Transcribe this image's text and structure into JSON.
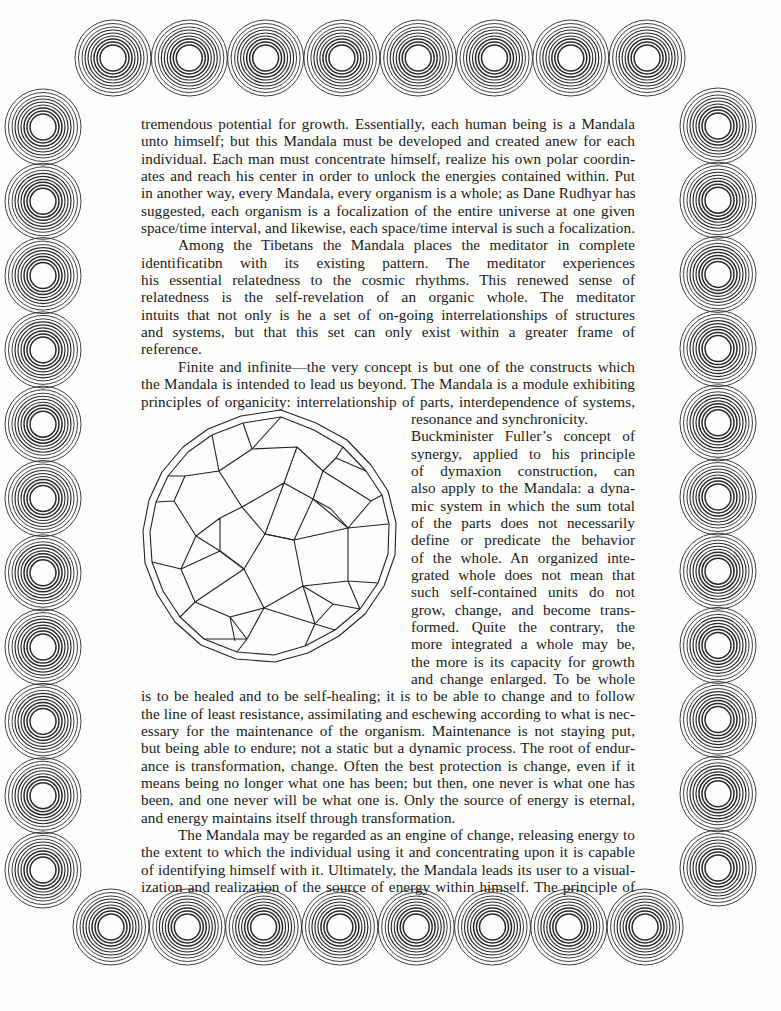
{
  "border": {
    "top_row": {
      "count": 8,
      "x_start": 113,
      "x_step": 76.3,
      "y": 58
    },
    "bottom_row": {
      "count": 8,
      "x_start": 111,
      "x_step": 76.3,
      "y": 927
    },
    "left_column": {
      "count": 11,
      "x": 43,
      "y_start": 127,
      "y_step": 74.3
    },
    "right_column": {
      "count": 11,
      "x": 718,
      "y_start": 126,
      "y_step": 74.2
    },
    "ring_radii": [
      13,
      16,
      19,
      22,
      25,
      28,
      31,
      34.5,
      38
    ],
    "ring_color": "#2a2a2a"
  },
  "body_text": {
    "paragraphs": [
      {
        "id": "p1",
        "lines": [
          "tremendous potential for growth. Essentially, each human being is a Mandala",
          "unto himself; but this Mandala must be developed and created anew for each",
          "individual. Each man must concentrate himself, realize his own polar coordin-",
          "ates and reach his center in order to unlock the energies contained within. Put",
          "in another way, every Mandala, every organism is a whole; as Dane Rudhyar has",
          "suggested, each organism is a focalization of the entire universe at one given",
          "space/time interval, and likewise, each space/time interval is such a focalization."
        ]
      },
      {
        "id": "p2",
        "lines": [
          "Among the Tibetans the Mandala places the meditator in complete",
          "identificatibn with its existing pattern. The meditator experiences",
          "his essential relatedness to the cosmic rhythms. This renewed sense of",
          "relatedness is the self-revelation of an organic whole. The meditator",
          "intuits that not only is he a set of on-going interrelationships of structures",
          "and systems, but that this set can only exist within a greater frame of",
          "reference."
        ]
      },
      {
        "id": "p3",
        "lines": [
          "Finite and infinite—the very concept is but one of the constructs which",
          "the Mandala is intended to lead us beyond. The Mandala is a module exhibiting",
          "principles of organicity: interrelationship of parts, interdependence of systems,"
        ],
        "narrow_lines": [
          "resonance  and synchronicity.",
          "Buckminister Fuller’s concept of",
          "synergy, applied to his principle",
          "of dymaxion construction, can",
          "also apply to the Mandala: a dyna-",
          "mic system in which the sum total",
          "of the parts does not necessarily",
          "define or predicate the behavior",
          "of the whole. An organized inte-",
          "grated whole does not mean that",
          "such self-contained units do not",
          "grow, change, and become trans-",
          "formed. Quite the contrary, the",
          "more integrated a whole may be,",
          "the more is its capacity for growth",
          "and change enlarged. To be whole"
        ],
        "tail_lines": [
          "is to be healed and to be self-healing; it is to be able to change and to follow",
          "the line of least resistance, assimilating and eschewing according to what is nec-",
          "essary for the maintenance of the organism. Maintenance is not staying put,",
          "but being able to endure; not a static but a dynamic process. The root of endur-",
          "ance is transformation, change. Often the best protection is change, even if it",
          "means being no longer what one has been; but then, one never is what one has",
          "been, and one never will be what one is. Only the source of energy is eternal,",
          "and energy maintains itself through transformation."
        ]
      },
      {
        "id": "p4",
        "lines": [
          "The Mandala may be regarded as an engine of change, releasing energy to",
          "the extent to which the individual using it and concentrating upon it is capable",
          "of identifying himself with it. Ultimately, the Mandala leads its user to a visual-",
          "ization and realization of the source of energy within himself. The principle of"
        ]
      }
    ]
  },
  "figure": {
    "name": "polyhedron-illustration"
  }
}
